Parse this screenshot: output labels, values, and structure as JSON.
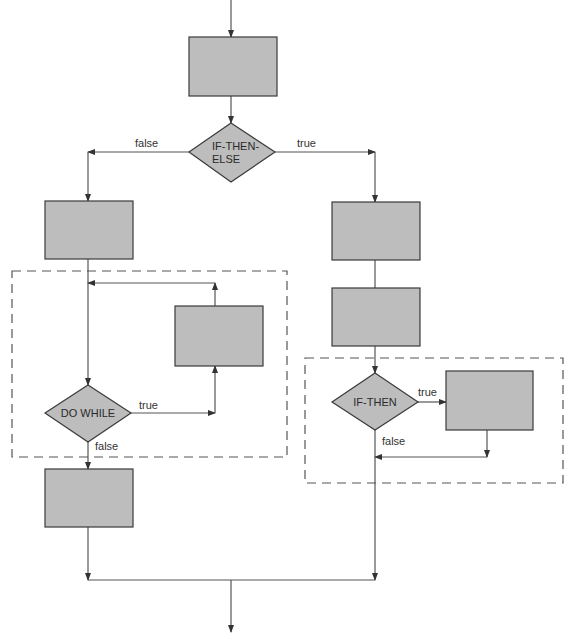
{
  "colors": {
    "box_fill": "#bdbdbd",
    "stroke": "#3a3a3a",
    "line": "#555555",
    "dashed": "#555555",
    "background": "#ffffff"
  },
  "diagram": {
    "decisions": {
      "if_then_else": {
        "line1": "IF-THEN-",
        "line2": "ELSE"
      },
      "do_while": {
        "label": "DO WHILE"
      },
      "if_then": {
        "label": "IF-THEN"
      }
    },
    "edge_labels": {
      "ite_false": "false",
      "ite_true": "true",
      "dowhile_true": "true",
      "dowhile_false": "false",
      "ifthen_true": "true",
      "ifthen_false": "false"
    }
  }
}
